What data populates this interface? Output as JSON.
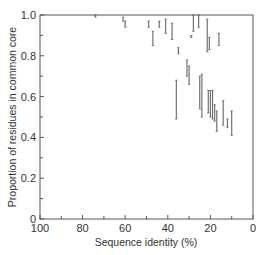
{
  "chart_data": {
    "type": "errorbar",
    "title": "",
    "xlabel": "Sequence identity (%)",
    "ylabel": "Proportion of residues in common core",
    "xlim": [
      100,
      0
    ],
    "ylim": [
      0,
      1.0
    ],
    "x_ticks": [
      100,
      80,
      60,
      40,
      20,
      0
    ],
    "x_tick_labels": [
      "100",
      "80",
      "60",
      "40",
      "20",
      "0"
    ],
    "y_ticks": [
      0,
      0.2,
      0.4,
      0.6,
      0.8,
      1.0
    ],
    "y_tick_labels": [
      "0",
      "0.2",
      "0.4",
      "0.6",
      "0.8",
      "1.0"
    ],
    "grid": false,
    "legend": null,
    "series": [
      {
        "name": "protein pairs",
        "points": [
          {
            "x": 74,
            "ymin": 0.99,
            "ymax": 1.0
          },
          {
            "x": 61,
            "ymin": 0.97,
            "ymax": 0.99
          },
          {
            "x": 60,
            "ymin": 0.94,
            "ymax": 0.97
          },
          {
            "x": 49,
            "ymin": 0.94,
            "ymax": 0.97
          },
          {
            "x": 47,
            "ymin": 0.85,
            "ymax": 0.92
          },
          {
            "x": 44,
            "ymin": 0.94,
            "ymax": 0.97
          },
          {
            "x": 41,
            "ymin": 0.91,
            "ymax": 0.98
          },
          {
            "x": 38,
            "ymin": 0.88,
            "ymax": 0.96
          },
          {
            "x": 36,
            "ymin": 0.49,
            "ymax": 0.68
          },
          {
            "x": 35,
            "ymin": 0.81,
            "ymax": 0.84
          },
          {
            "x": 31,
            "ymin": 0.7,
            "ymax": 0.78
          },
          {
            "x": 30,
            "ymin": 0.66,
            "ymax": 0.75
          },
          {
            "x": 29,
            "ymin": 0.89,
            "ymax": 0.9
          },
          {
            "x": 28,
            "ymin": 0.92,
            "ymax": 1.0
          },
          {
            "x": 25.5,
            "ymin": 0.94,
            "ymax": 1.0
          },
          {
            "x": 25,
            "ymin": 0.54,
            "ymax": 0.7
          },
          {
            "x": 24,
            "ymin": 0.5,
            "ymax": 0.71
          },
          {
            "x": 21.5,
            "ymin": 0.82,
            "ymax": 0.98
          },
          {
            "x": 21,
            "ymin": 0.52,
            "ymax": 0.63
          },
          {
            "x": 20.5,
            "ymin": 0.83,
            "ymax": 0.89
          },
          {
            "x": 20,
            "ymin": 0.5,
            "ymax": 0.63
          },
          {
            "x": 19,
            "ymin": 0.49,
            "ymax": 0.63
          },
          {
            "x": 18,
            "ymin": 0.48,
            "ymax": 0.56
          },
          {
            "x": 17,
            "ymin": 0.43,
            "ymax": 0.53
          },
          {
            "x": 16,
            "ymin": 0.85,
            "ymax": 0.91
          },
          {
            "x": 14,
            "ymin": 0.46,
            "ymax": 0.58
          },
          {
            "x": 12,
            "ymin": 0.45,
            "ymax": 0.49
          },
          {
            "x": 10,
            "ymin": 0.41,
            "ymax": 0.53
          }
        ]
      }
    ]
  },
  "style": {
    "axis_color": "#555555",
    "bar_color": "#666666",
    "text_color": "#333333"
  }
}
